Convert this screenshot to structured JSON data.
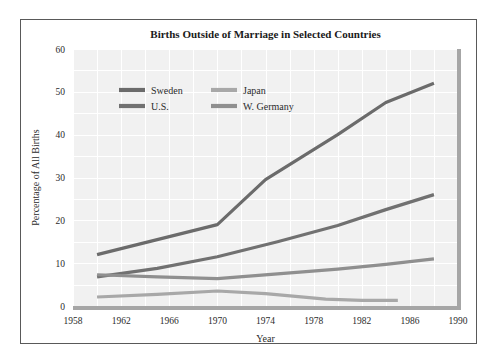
{
  "figure": {
    "title": "Births Outside of Marriage in Selected Countries",
    "frame_color": "#595959",
    "plot_bg": "#f1f1f1",
    "grid_color": "#ffffff",
    "axis_color": "#a6a6a6"
  },
  "axes": {
    "y_title": "Percentage of All Births",
    "x_title": "Year",
    "y_ticks": [
      "0",
      "10",
      "20",
      "30",
      "40",
      "50",
      "60"
    ],
    "x_ticks": [
      "1958",
      "1962",
      "1966",
      "1970",
      "1974",
      "1978",
      "1982",
      "1986",
      "1990"
    ]
  },
  "legend": {
    "entries": [
      {
        "label": "Sweden",
        "color": "#6b6b6b"
      },
      {
        "label": "Japan",
        "color": "#a8a8a8"
      },
      {
        "label": "U.S.",
        "color": "#717171"
      },
      {
        "label": "W. Germany",
        "color": "#8f8f8f"
      }
    ]
  },
  "chart_data": {
    "type": "line",
    "title": "Births Outside of Marriage in Selected Countries",
    "xlabel": "Year",
    "ylabel": "Percentage of All Births",
    "xlim": [
      1958,
      1990
    ],
    "ylim": [
      0,
      60
    ],
    "grid": true,
    "legend_position": "upper-left-inside",
    "series": [
      {
        "name": "Sweden",
        "color": "#6b6b6b",
        "x": [
          1960,
          1965,
          1970,
          1974,
          1980,
          1984,
          1988
        ],
        "values": [
          12.0,
          15.5,
          19.0,
          29.5,
          40.0,
          47.5,
          52.0
        ]
      },
      {
        "name": "U.S.",
        "color": "#717171",
        "x": [
          1960,
          1965,
          1970,
          1975,
          1980,
          1984,
          1988
        ],
        "values": [
          6.8,
          8.8,
          11.5,
          15.0,
          18.8,
          22.5,
          26.0
        ]
      },
      {
        "name": "W. Germany",
        "color": "#8f8f8f",
        "x": [
          1960,
          1965,
          1970,
          1975,
          1980,
          1984,
          1988
        ],
        "values": [
          7.3,
          6.8,
          6.4,
          7.5,
          8.6,
          9.7,
          11.0
        ]
      },
      {
        "name": "Japan",
        "color": "#a8a8a8",
        "x": [
          1960,
          1965,
          1970,
          1974,
          1979,
          1982,
          1985
        ],
        "values": [
          2.1,
          2.7,
          3.5,
          2.9,
          1.6,
          1.3,
          1.3
        ]
      }
    ]
  }
}
